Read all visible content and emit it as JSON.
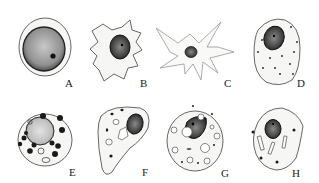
{
  "figure": {
    "colors": {
      "background": "#ffffff",
      "outline": "#555555",
      "cytoplasm": "#f6f6f4",
      "nucleus": "#3a3a3a",
      "granule": "#222222"
    },
    "cells": [
      {
        "label": "A",
        "shape": "round cell with large stippled nucleus and dark nucleolus"
      },
      {
        "label": "B",
        "shape": "irregular star-shaped cell with oval dark nucleus"
      },
      {
        "label": "C",
        "shape": "stellate cell with long thin processes and small nucleus"
      },
      {
        "label": "D",
        "shape": "oval cell with eccentric dark nucleus and scattered dots"
      },
      {
        "label": "E",
        "shape": "round cell with central nucleus surrounded by dark granules"
      },
      {
        "label": "F",
        "shape": "teardrop cell with nucleus, vacuoles and granules"
      },
      {
        "label": "G",
        "shape": "oval cell with nucleus and multiple clear vacuoles"
      },
      {
        "label": "H",
        "shape": "rounded cell with nucleus and rod-shaped crystals"
      }
    ]
  }
}
